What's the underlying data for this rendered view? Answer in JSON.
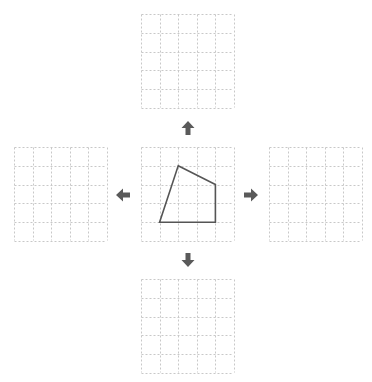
{
  "diagram": {
    "grid_size": 5,
    "colors": {
      "grid_line": "#c8c8c8",
      "shape_stroke": "#555555",
      "arrow_fill": "#5a5a5a",
      "background": "#ffffff"
    },
    "center_shape": {
      "type": "quadrilateral",
      "vertices_grid_units": [
        [
          2,
          1
        ],
        [
          4,
          2
        ],
        [
          4,
          4
        ],
        [
          1,
          4
        ]
      ]
    },
    "grids": [
      {
        "id": "top",
        "x": 141,
        "y": 14,
        "empty": true
      },
      {
        "id": "left",
        "x": 14,
        "y": 147,
        "empty": true
      },
      {
        "id": "center",
        "x": 141,
        "y": 147,
        "empty": false
      },
      {
        "id": "right",
        "x": 269,
        "y": 147,
        "empty": true
      },
      {
        "id": "bottom",
        "x": 141,
        "y": 279,
        "empty": true
      }
    ],
    "arrows": [
      {
        "id": "up",
        "direction": "up",
        "x": 181,
        "y": 121
      },
      {
        "id": "left",
        "direction": "left",
        "x": 116,
        "y": 188
      },
      {
        "id": "right",
        "direction": "right",
        "x": 244,
        "y": 188
      },
      {
        "id": "down",
        "direction": "down",
        "x": 181,
        "y": 253
      }
    ]
  }
}
